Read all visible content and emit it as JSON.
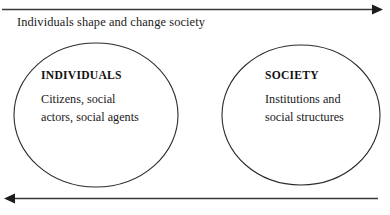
{
  "diagram": {
    "arrows": [
      {
        "id": "top-arrow",
        "label": "Individuals shape and change society",
        "direction": "right"
      },
      {
        "id": "bottom-arrow",
        "label": "",
        "direction": "left"
      }
    ],
    "nodes": [
      {
        "id": "individuals",
        "title": "INDIVIDUALS",
        "description_line1": "Citizens, social",
        "description_line2": "actors, social agents"
      },
      {
        "id": "society",
        "title": "SOCIETY",
        "description_line1": "Institutions and",
        "description_line2": "social structures"
      }
    ],
    "colors": {
      "stroke": "#2b2b2b",
      "arrow": "#3a3a3a",
      "text": "#1a1a1a",
      "background": "#ffffff"
    }
  }
}
